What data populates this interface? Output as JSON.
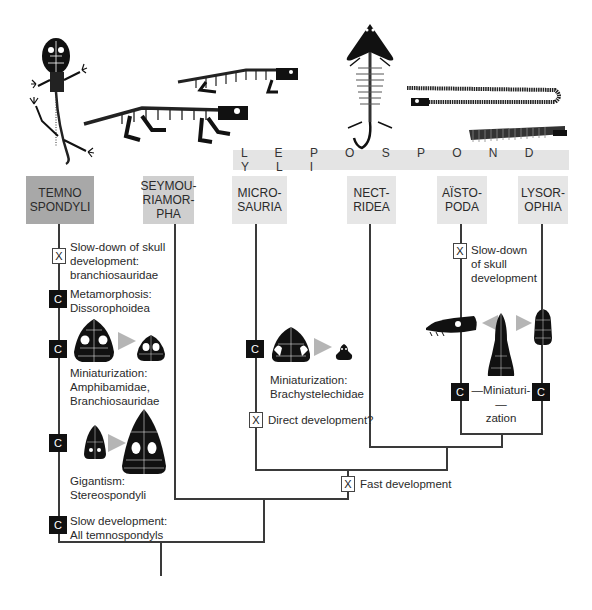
{
  "clade_label": "L E P O S P O N D Y L I",
  "taxa": [
    {
      "id": "temnospondyli",
      "label": "TEMNO\nSPONDYLI",
      "color": "#a8a8a8"
    },
    {
      "id": "seymouriamorpha",
      "label": "SEYMOU-\nRIAMOR-\nPHA",
      "color": "#cfcfcf"
    },
    {
      "id": "microsauria",
      "label": "MICRO-\nSAURIA",
      "color": "#e6e6e6"
    },
    {
      "id": "nectridea",
      "label": "NECT-\nRIDEA",
      "color": "#e6e6e6"
    },
    {
      "id": "aistopoda",
      "label": "AÏSTO-\nPODA",
      "color": "#e6e6e6"
    },
    {
      "id": "lysorophia",
      "label": "LYSOR-\nOPHIA",
      "color": "#e6e6e6"
    }
  ],
  "markers": {
    "x_symbol": "X",
    "c_symbol": "C"
  },
  "events": {
    "temno_slowdown": "Slow-down of skull\ndevelopment:\nbranchiosauridae",
    "temno_metamorphosis": "Metamorphosis:\nDissorophoidea",
    "temno_miniaturization": "Miniaturization:\nAmphibamidae,\nBranchiosauridae",
    "temno_gigantism": "Gigantism:\nStereospondyli",
    "temno_slow_dev": "Slow development:\nAll temnospondyls",
    "micro_miniaturization": "Miniaturization:\nBrachystelechidae",
    "micro_direct": "Direct development?",
    "fast_development": "Fast development",
    "aisto_slowdown": "Slow-down\nof skull\ndevelopment",
    "aisto_lyso_miniaturization": "—Miniaturi-—\nzation"
  }
}
